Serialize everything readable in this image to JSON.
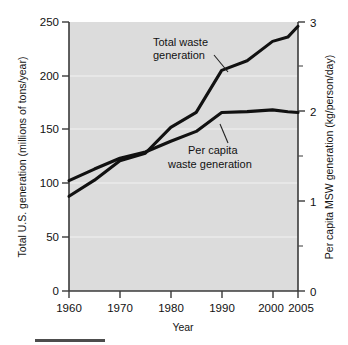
{
  "chart_data": {
    "type": "line",
    "title": "",
    "subtitle": "",
    "xlabel": "Year",
    "ylabel": "Total U.S. generation (millions of tons/year)",
    "y2label": "Per capita MSW generation (kg/person/day)",
    "xlim": [
      1960,
      2005
    ],
    "ylim": [
      0,
      250
    ],
    "y2lim": [
      0,
      3
    ],
    "grid": true,
    "legend_position": "inline-annotations",
    "x_ticks": [
      1960,
      1970,
      1980,
      1990,
      2000,
      2005
    ],
    "x_tick_labels": [
      "1960",
      "1970",
      "1980",
      "1990",
      "2000",
      "2005"
    ],
    "y_ticks": [
      0,
      50,
      100,
      150,
      200,
      250
    ],
    "y_tick_labels": [
      "0",
      "50",
      "100",
      "150",
      "200",
      "250"
    ],
    "y2_ticks": [
      0,
      1,
      2,
      3
    ],
    "y2_tick_labels": [
      "0",
      "1",
      "2",
      "3"
    ],
    "y2_minor_ticks": [
      0.5,
      1.5,
      2.5
    ],
    "series": [
      {
        "name": "Total waste generation",
        "axis": "left",
        "units": "millions of tons/year",
        "x": [
          1960,
          1965,
          1970,
          1975,
          1980,
          1985,
          1990,
          1995,
          2000,
          2003,
          2005
        ],
        "values": [
          88,
          103,
          121,
          128,
          152,
          166,
          205,
          214,
          232,
          236,
          246
        ]
      },
      {
        "name": "Per capita waste generation",
        "axis": "right",
        "units": "kg/person/day",
        "x": [
          1960,
          1965,
          1970,
          1975,
          1980,
          1985,
          1990,
          1995,
          2000,
          2003,
          2005
        ],
        "values": [
          1.23,
          1.36,
          1.48,
          1.55,
          1.67,
          1.78,
          1.99,
          2.0,
          2.02,
          2.0,
          1.99
        ]
      }
    ],
    "annotations": [
      {
        "text_line1": "Total waste",
        "text_line2": "generation",
        "target_series": "Total waste generation"
      },
      {
        "text_line1": "Per capita",
        "text_line2": "waste generation",
        "target_series": "Per capita waste generation"
      }
    ],
    "colors": {
      "plot_background": "#dcdcdc",
      "grid": "#f2f2f2",
      "line": "#111111",
      "axis": "#3a3a3a",
      "text": "#121212",
      "page_background": "#ffffff"
    }
  }
}
